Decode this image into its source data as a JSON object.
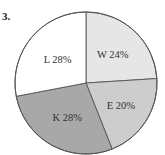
{
  "question_number": "3.",
  "chart_data": {
    "type": "pie",
    "title": "",
    "start_angle_deg": -90,
    "direction": "clockwise",
    "categories": [
      "W",
      "E",
      "K",
      "L"
    ],
    "values": [
      24,
      20,
      28,
      28
    ],
    "unit": "%",
    "labels": [
      "W 24%",
      "E 20%",
      "K 28%",
      "L 28%"
    ],
    "colors": [
      "#e6e6e6",
      "#cdcdcd",
      "#a8a8a8",
      "#ffffff"
    ],
    "legend": "none",
    "outline_color": "#555555"
  }
}
